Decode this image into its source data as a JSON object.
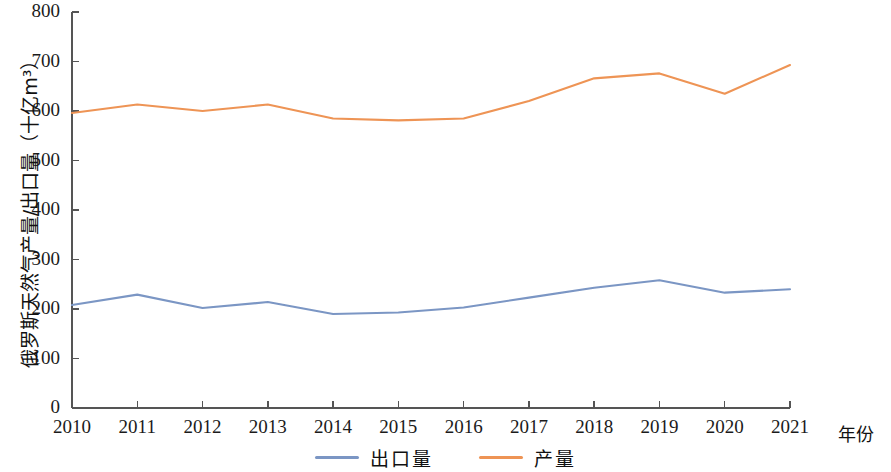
{
  "chart_data": {
    "type": "line",
    "title": "",
    "xlabel": "年份",
    "ylabel": "俄罗斯天然气产量/出口量（十亿m³）",
    "x": [
      2010,
      2011,
      2012,
      2013,
      2014,
      2015,
      2016,
      2017,
      2018,
      2019,
      2020,
      2021
    ],
    "xtick_labels": [
      "2010",
      "2011",
      "2012",
      "2013",
      "2014",
      "2015",
      "2016",
      "2017",
      "2018",
      "2019",
      "2020",
      "2021"
    ],
    "ytick_labels": [
      "0",
      "100",
      "200",
      "300",
      "400",
      "500",
      "600",
      "700",
      "800"
    ],
    "yticks": [
      0,
      100,
      200,
      300,
      400,
      500,
      600,
      700,
      800
    ],
    "ylim": [
      0,
      800
    ],
    "xlim": [
      2010,
      2021
    ],
    "grid": false,
    "legend_position": "bottom-center",
    "series": [
      {
        "name": "出口量",
        "color": "#7b96c4",
        "values": [
          208,
          229,
          202,
          214,
          190,
          193,
          203,
          223,
          243,
          258,
          233,
          240
        ]
      },
      {
        "name": "产量",
        "color": "#ee9455",
        "values": [
          596,
          613,
          600,
          613,
          585,
          581,
          585,
          620,
          666,
          676,
          635,
          693
        ]
      }
    ]
  },
  "axis": {
    "y_label": "俄罗斯天然气产量/出口量（十亿m³）",
    "x_unit_label": "年份"
  },
  "legend": {
    "items": [
      {
        "label": "出口量",
        "color": "#7b96c4"
      },
      {
        "label": "产量",
        "color": "#ee9455"
      }
    ]
  }
}
